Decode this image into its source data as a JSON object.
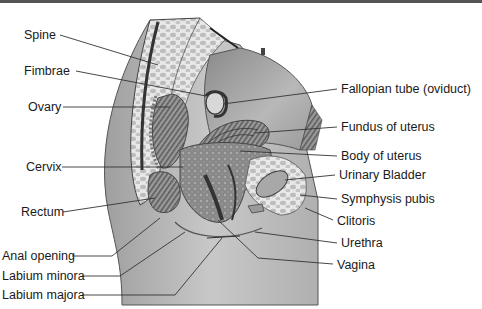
{
  "figure": {
    "left_labels": [
      {
        "text": "Spine",
        "x": 24,
        "y": 28
      },
      {
        "text": "Fimbrae",
        "x": 24,
        "y": 64
      },
      {
        "text": "Ovary",
        "x": 28,
        "y": 100
      },
      {
        "text": "Cervix",
        "x": 26,
        "y": 160
      },
      {
        "text": "Rectum",
        "x": 21,
        "y": 206
      },
      {
        "text": "Anal opening",
        "x": 2,
        "y": 250
      },
      {
        "text": "Labium minora",
        "x": 2,
        "y": 270
      },
      {
        "text": "Labium majora",
        "x": 2,
        "y": 289
      }
    ],
    "right_labels": [
      {
        "text": "Fallopian tube (oviduct)",
        "x": 341,
        "y": 83
      },
      {
        "text": "Fundus of uterus",
        "x": 341,
        "y": 120
      },
      {
        "text": "Body of uterus",
        "x": 341,
        "y": 149
      },
      {
        "text": "Urinary Bladder",
        "x": 339,
        "y": 169
      },
      {
        "text": "Symphysis pubis",
        "x": 341,
        "y": 193
      },
      {
        "text": "Clitoris",
        "x": 337,
        "y": 214
      },
      {
        "text": "Urethra",
        "x": 341,
        "y": 237
      },
      {
        "text": "Vagina",
        "x": 337,
        "y": 259
      }
    ]
  }
}
